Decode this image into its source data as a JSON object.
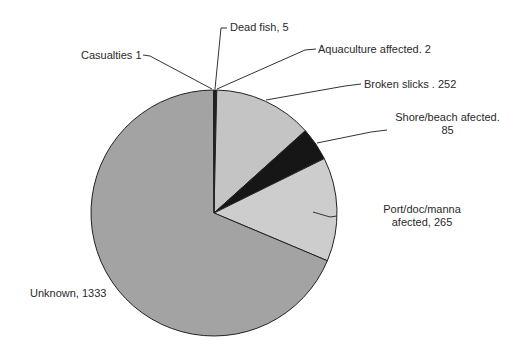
{
  "chart_data": {
    "type": "pie",
    "title": "",
    "start_angle_deg": 0,
    "direction": "clockwise",
    "slices": [
      {
        "label": "Dead fish",
        "value": 5,
        "color": "#1a1a1a"
      },
      {
        "label": "Aquaculture affected",
        "value": 2,
        "color": "#1a1a1a"
      },
      {
        "label": "Broken slicks",
        "value": 252,
        "color": "#c4c4c4"
      },
      {
        "label": "Shore/beach afected",
        "value": 85,
        "color": "#161616"
      },
      {
        "label": "Port/doc/manna afected",
        "value": 265,
        "color": "#cdcdcd"
      },
      {
        "label": "Unknown",
        "value": 1333,
        "color": "#a3a3a3"
      },
      {
        "label": "Casualties",
        "value": 1,
        "color": "#1a1a1a"
      }
    ],
    "total": 1943
  },
  "labels": {
    "casualties": "Casualties 1",
    "dead_fish": "Dead fish, 5",
    "aquaculture": "Aquaculture affected. 2",
    "broken_slicks": "Broken slicks . 252",
    "shore_line1": "Shore/beach afected.",
    "shore_line2": "85",
    "port_line1": "Port/doc/manna",
    "port_line2": "afected, 265",
    "unknown": "Unknown, 1333"
  }
}
